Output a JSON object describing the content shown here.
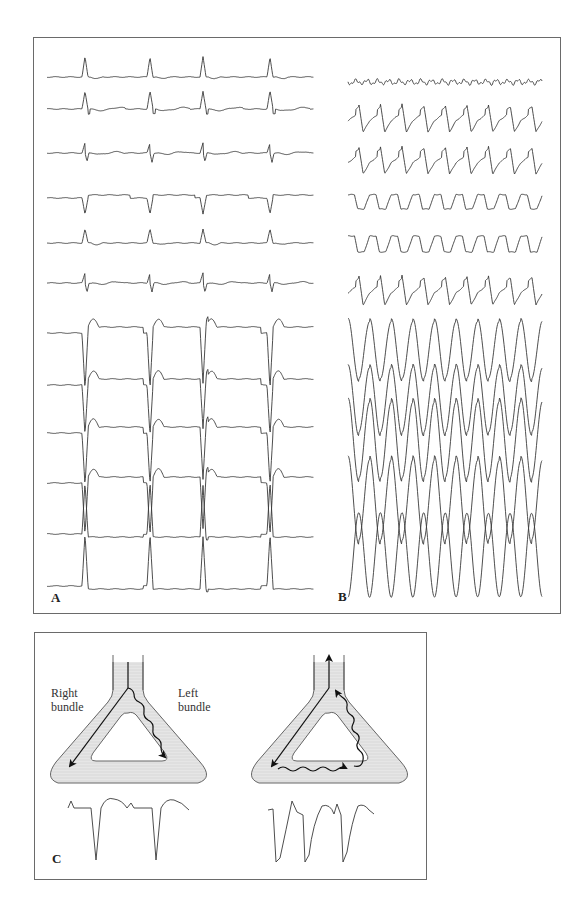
{
  "figure": {
    "panels": {
      "A": {
        "label": "A"
      },
      "B": {
        "label": "B"
      },
      "C": {
        "label": "C",
        "left_diagram": {
          "right_label_line1": "Right",
          "right_label_line2": "bundle",
          "left_label_line1": "Left",
          "left_label_line2": "bundle"
        }
      }
    }
  },
  "traces": {
    "A": {
      "x_start": 47,
      "x_end": 314,
      "beats": [
        85,
        150,
        203,
        270
      ],
      "rows": [
        {
          "baseline": 77,
          "type": "upright",
          "amp": -20
        },
        {
          "baseline": 109,
          "type": "notched",
          "amp": -18
        },
        {
          "baseline": 153,
          "type": "biphasic",
          "amp": -10
        },
        {
          "baseline": 198,
          "type": "inverted",
          "amp": 16
        },
        {
          "baseline": 243,
          "type": "upright",
          "amp": -14
        },
        {
          "baseline": 283,
          "type": "biphasic",
          "amp": -10
        },
        {
          "baseline": 333,
          "type": "deep",
          "amp": 56
        },
        {
          "baseline": 385,
          "type": "deep",
          "amp": 50
        },
        {
          "baseline": 433,
          "type": "deep",
          "amp": 52
        },
        {
          "baseline": 483,
          "type": "deep",
          "amp": 52
        },
        {
          "baseline": 534,
          "type": "deep_up",
          "amp": -52
        },
        {
          "baseline": 586,
          "type": "deep_up",
          "amp": -52
        }
      ]
    },
    "B": {
      "x_start": 348,
      "x_end": 542,
      "period": 21.6,
      "beats_count": 9,
      "rows": [
        {
          "baseline": 82,
          "type": "noise",
          "amp": 4
        },
        {
          "baseline": 118,
          "type": "wide",
          "amp": 14
        },
        {
          "baseline": 160,
          "type": "wide",
          "amp": 14
        },
        {
          "baseline": 200,
          "type": "wide_inv",
          "amp": 9
        },
        {
          "baseline": 242,
          "type": "wide_inv",
          "amp": 10
        },
        {
          "baseline": 290,
          "type": "wide",
          "amp": 15
        },
        {
          "baseline": 350,
          "type": "huge",
          "amp": 30
        },
        {
          "baseline": 400,
          "type": "huge",
          "amp": 34
        },
        {
          "baseline": 440,
          "type": "huge",
          "amp": 40
        },
        {
          "baseline": 500,
          "type": "huge",
          "amp": 42
        },
        {
          "baseline": 555,
          "type": "huge_inv",
          "amp": 42
        }
      ]
    }
  },
  "colors": {
    "stroke": "#3a3a3a",
    "fill": "#e4e4e4",
    "frame": "#6a6a6a"
  }
}
